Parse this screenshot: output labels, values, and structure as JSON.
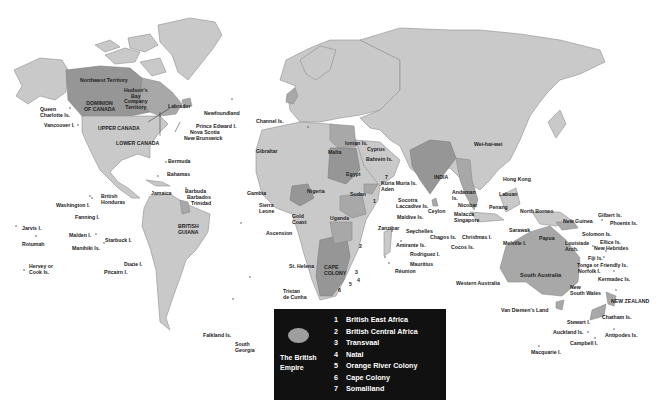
{
  "map": {
    "title": "The British Empire",
    "colors": {
      "land": "#c9c9c9",
      "empire": "#a8a8a8",
      "legend_bg": "#111111",
      "legend_text": "#ffffff"
    }
  },
  "legend": {
    "title": "The British\nEmpire",
    "items": [
      {
        "num": "1",
        "label": "British East Africa"
      },
      {
        "num": "2",
        "label": "British Central Africa"
      },
      {
        "num": "3",
        "label": "Transvaal"
      },
      {
        "num": "4",
        "label": "Natal"
      },
      {
        "num": "5",
        "label": "Orange River Colony"
      },
      {
        "num": "6",
        "label": "Cape Colony"
      },
      {
        "num": "7",
        "label": "Somaliland"
      }
    ]
  },
  "labels": {
    "northwest_territory": "Northwest Territory",
    "hudsons_bay": "Hudson's\nBay\nCompany\nTerritory",
    "dominion_canada": "DOMINION\nOF CANADA",
    "labrador": "Labrador",
    "newfoundland": "Newfoundland",
    "queen_charlotte": "Queen\nCharlotte Is.",
    "vancouver": "Vancouver I.",
    "upper_canada": "UPPER CANADA",
    "lower_canada": "LOWER CANADA",
    "prince_edward": "Prince Edward I.",
    "nova_scotia": "Nova Scotia",
    "new_brunswick": "New Brunswick",
    "bermuda": "Bermuda",
    "bahamas": "Bahamas",
    "jamaica": "Jamaica",
    "barbuda": "Barbuda",
    "barbados": "Barbados",
    "trinidad": "Trinidad",
    "british_honduras": "British\nHonduras",
    "british_guiana": "BRITISH\nGUIANA",
    "washington": "Washington I.",
    "fanning": "Fanning I.",
    "jarvis": "Jarvis I.",
    "malden": "Malden I.",
    "starbuck": "Starbuck I.",
    "rotumah": "Rotumah",
    "manihiki": "Manihiki Is.",
    "hervey": "Hervey or\nCook Is.",
    "ducie": "Ducie I.",
    "pitcairn": "Pitcairn I.",
    "falkland": "Falkland Is.",
    "south_georgia": "South\nGeorgia",
    "channel": "Channel Is.",
    "gibraltar": "Gibraltar",
    "malta": "Malta",
    "ionian": "Ionian Is.",
    "cyprus": "Cyprus",
    "bahrein": "Bahrein Is.",
    "egypt": "Egypt",
    "gambia": "Gambia",
    "sierra_leone": "Sierra\nLeone",
    "nigeria": "Nigeria",
    "sudan": "Sudan",
    "gold_coast": "Gold\nCoast",
    "uganda": "Uganda",
    "ascension": "Ascension",
    "st_helena": "St. Helena",
    "cape_colony": "CAPE\nCOLONY",
    "tristan": "Tristan\nde Cunha",
    "kuria_muria": "Kuria Muria Is.",
    "aden": "Aden",
    "socotra": "Socotra",
    "laccadive": "Laccadive Is.",
    "maldive": "Maldive Is.",
    "zanzibar": "Zanzibar",
    "seychelles": "Seychelles",
    "amirante": "Amirante Is.",
    "rodriguez": "Rodriguez I.",
    "mauritius": "Mauritius",
    "reunion": "Réunion",
    "india": "INDIA",
    "ceylon": "Ceylon",
    "andaman": "Andaman\nIs.",
    "nicobar": "Nicobar",
    "malacca": "Malacca",
    "singapore": "Singapore",
    "chagos": "Chagos Is.",
    "christmas": "Christmas I.",
    "cocos": "Cocos Is.",
    "wei_hai_wei": "Wei-hai-wei",
    "hong_kong": "Hong Kong",
    "labuan": "Labuan",
    "penang": "Penang",
    "north_borneo": "North Borneo",
    "sarawak": "Sarawak",
    "melville": "Melville I.",
    "papua": "Papua",
    "new_guinea": "New Guinea",
    "louisiade": "Louisiade\nArch.",
    "gilbert": "Gilbert Is.",
    "phoenix": "Phoenix Is.",
    "solomon": "Solomon Is.",
    "ellice": "Ellice Is.",
    "new_hebrides": "New Hebrides",
    "fiji": "Fiji Is.",
    "tonga": "Tonga or Friendly Is.",
    "norfolk": "Norfolk I.",
    "kermadec": "Kermadec Is.",
    "south_australia": "South Australia",
    "western_australia": "Western Australia",
    "new_south_wales": "New\nSouth Wales",
    "van_diemens": "Van Diemen's Land",
    "new_zealand": "NEW ZEALAND",
    "chatham": "Chatham Is.",
    "stewart": "Stewart I.",
    "auckland": "Auckland Is.",
    "antipodes": "Antipodes Is.",
    "campbell": "Campbell I.",
    "macquarie": "Macquarie I."
  },
  "numbers": [
    "1",
    "2",
    "3",
    "4",
    "5",
    "6",
    "7"
  ]
}
